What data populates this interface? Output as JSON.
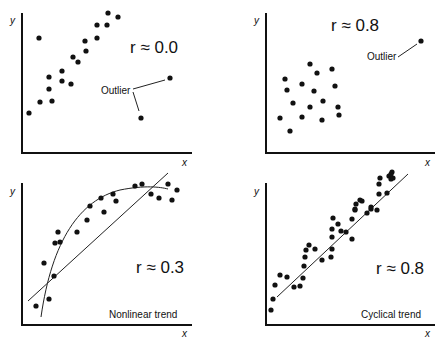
{
  "panels": [
    {
      "id": "top-left",
      "y_label": "y",
      "x_label": "x",
      "r_label": "r ≈ 0.0",
      "annotation": "Outlier",
      "points": [
        [
          29,
          113
        ],
        [
          39,
          38
        ],
        [
          40,
          102
        ],
        [
          49,
          77
        ],
        [
          49,
          89
        ],
        [
          52,
          101
        ],
        [
          62,
          71
        ],
        [
          62,
          81
        ],
        [
          71,
          84
        ],
        [
          73,
          57
        ],
        [
          78,
          62
        ],
        [
          85,
          41
        ],
        [
          86,
          51
        ],
        [
          97,
          25
        ],
        [
          97,
          38
        ],
        [
          107,
          25
        ],
        [
          108,
          13
        ],
        [
          118,
          17
        ]
      ],
      "outliers": [
        [
          170,
          78
        ],
        [
          141,
          118
        ]
      ]
    },
    {
      "id": "top-right",
      "y_label": "y",
      "x_label": "x",
      "r_label": "r ≈ 0.8",
      "annotation": "Outlier",
      "points": [
        [
          280,
          118
        ],
        [
          290,
          131
        ],
        [
          285,
          79
        ],
        [
          287,
          90
        ],
        [
          293,
          103
        ],
        [
          302,
          117
        ],
        [
          302,
          84
        ],
        [
          310,
          107
        ],
        [
          310,
          64
        ],
        [
          314,
          91
        ],
        [
          317,
          73
        ],
        [
          322,
          120
        ],
        [
          323,
          101
        ],
        [
          332,
          69
        ],
        [
          335,
          86
        ],
        [
          338,
          107
        ],
        [
          339,
          115
        ]
      ],
      "outliers": [
        [
          421,
          41
        ]
      ]
    },
    {
      "id": "bottom-left",
      "y_label": "y",
      "x_label": "x",
      "r_label": "r ≈ 0.3",
      "annotation": "Nonlinear trend",
      "points": [
        [
          36,
          306
        ],
        [
          44,
          263
        ],
        [
          49,
          299
        ],
        [
          55,
          243
        ],
        [
          54,
          276
        ],
        [
          58,
          232
        ],
        [
          60,
          242
        ],
        [
          77,
          232
        ],
        [
          87,
          220
        ],
        [
          90,
          206
        ],
        [
          101,
          198
        ],
        [
          104,
          212
        ],
        [
          113,
          194
        ],
        [
          116,
          201
        ],
        [
          135,
          186
        ],
        [
          142,
          184
        ],
        [
          151,
          194
        ],
        [
          159,
          198
        ],
        [
          168,
          184
        ],
        [
          172,
          200
        ],
        [
          177,
          190
        ]
      ]
    },
    {
      "id": "bottom-right",
      "y_label": "y",
      "x_label": "x",
      "r_label": "r ≈ 0.8",
      "annotation": "Cyclical trend",
      "points": [
        [
          271,
          310
        ],
        [
          273,
          299
        ],
        [
          275,
          285
        ],
        [
          280,
          275
        ],
        [
          287,
          277
        ],
        [
          294,
          287
        ],
        [
          300,
          286
        ],
        [
          303,
          278
        ],
        [
          304,
          266
        ],
        [
          305,
          257
        ],
        [
          306,
          250
        ],
        [
          309,
          245
        ],
        [
          315,
          249
        ],
        [
          322,
          260
        ],
        [
          331,
          257
        ],
        [
          332,
          249
        ],
        [
          332,
          237
        ],
        [
          332,
          229
        ],
        [
          333,
          218
        ],
        [
          338,
          224
        ],
        [
          341,
          231
        ],
        [
          346,
          232
        ],
        [
          352,
          239
        ],
        [
          352,
          219
        ],
        [
          355,
          210
        ],
        [
          355,
          209
        ],
        [
          356,
          204
        ],
        [
          360,
          200
        ],
        [
          362,
          201
        ],
        [
          367,
          213
        ],
        [
          371,
          209
        ],
        [
          371,
          207
        ],
        [
          377,
          210
        ],
        [
          379,
          194
        ],
        [
          379,
          184
        ],
        [
          380,
          178
        ],
        [
          387,
          193
        ],
        [
          389,
          176
        ],
        [
          391,
          179
        ],
        [
          392,
          172
        ],
        [
          393,
          178
        ],
        [
          391,
          174
        ]
      ]
    }
  ]
}
